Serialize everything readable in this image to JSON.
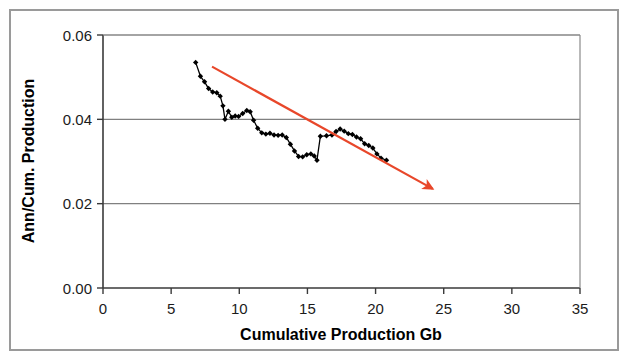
{
  "figure": {
    "background_color": "#ffffff",
    "frame_color": "#9a9a9a"
  },
  "chart_data": {
    "type": "line",
    "title": "",
    "subtitle": "",
    "xlabel": "Cumulative Production Gb",
    "ylabel": "Ann/Cum. Production",
    "xlim": [
      0,
      35
    ],
    "ylim": [
      0.0,
      0.06
    ],
    "xticks": [
      0,
      5,
      10,
      15,
      20,
      25,
      30,
      35
    ],
    "xtick_labels": [
      "0",
      "5",
      "10",
      "15",
      "20",
      "25",
      "30",
      "35"
    ],
    "yticks": [
      0.0,
      0.02,
      0.04,
      0.06
    ],
    "ytick_labels": [
      "0.00",
      "0.02",
      "0.04",
      "0.06"
    ],
    "grid": {
      "horizontal": true,
      "vertical": false,
      "color": "#808080"
    },
    "legend": {
      "visible": false,
      "position": "none"
    },
    "series": [
      {
        "name": "Ann/Cum. Production",
        "type": "line",
        "color": "#000000",
        "marker": "diamond",
        "marker_color": "#000000",
        "points": [
          [
            6.8,
            0.0535
          ],
          [
            7.15,
            0.0502
          ],
          [
            7.45,
            0.0489
          ],
          [
            7.75,
            0.0473
          ],
          [
            8.05,
            0.0465
          ],
          [
            8.35,
            0.0463
          ],
          [
            8.6,
            0.0455
          ],
          [
            8.8,
            0.0432
          ],
          [
            8.95,
            0.04
          ],
          [
            9.2,
            0.0419
          ],
          [
            9.45,
            0.0405
          ],
          [
            9.7,
            0.0408
          ],
          [
            9.95,
            0.0407
          ],
          [
            10.25,
            0.0414
          ],
          [
            10.55,
            0.0421
          ],
          [
            10.8,
            0.0418
          ],
          [
            11.05,
            0.0398
          ],
          [
            11.35,
            0.0379
          ],
          [
            11.65,
            0.0368
          ],
          [
            11.95,
            0.0365
          ],
          [
            12.25,
            0.0367
          ],
          [
            12.55,
            0.0363
          ],
          [
            12.85,
            0.0362
          ],
          [
            13.15,
            0.0363
          ],
          [
            13.45,
            0.0357
          ],
          [
            13.75,
            0.0341
          ],
          [
            14.05,
            0.0325
          ],
          [
            14.35,
            0.0312
          ],
          [
            14.65,
            0.0311
          ],
          [
            14.95,
            0.0316
          ],
          [
            15.25,
            0.0318
          ],
          [
            15.5,
            0.0313
          ],
          [
            15.7,
            0.0303
          ],
          [
            15.95,
            0.036
          ],
          [
            16.4,
            0.0361
          ],
          [
            16.8,
            0.0363
          ],
          [
            17.1,
            0.0371
          ],
          [
            17.4,
            0.0377
          ],
          [
            17.7,
            0.0372
          ],
          [
            18.0,
            0.0366
          ],
          [
            18.3,
            0.0364
          ],
          [
            18.6,
            0.0358
          ],
          [
            18.9,
            0.0354
          ],
          [
            19.2,
            0.0342
          ],
          [
            19.5,
            0.0338
          ],
          [
            19.8,
            0.0332
          ],
          [
            20.1,
            0.0318
          ],
          [
            20.4,
            0.0308
          ],
          [
            20.8,
            0.0303
          ]
        ]
      }
    ],
    "annotations": [
      {
        "kind": "trend-arrow",
        "color": "#e8472a",
        "from": [
          8.0,
          0.0525
        ],
        "to": [
          24.2,
          0.0235
        ],
        "arrowhead": "end"
      }
    ]
  }
}
